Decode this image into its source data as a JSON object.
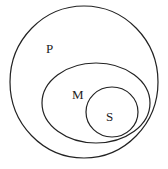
{
  "diagram": {
    "type": "nested-sets",
    "sets": [
      {
        "label": "P",
        "cx": 84,
        "cy": 82,
        "rx": 74,
        "ry": 76,
        "label_x": 46,
        "label_y": 53
      },
      {
        "label": "M",
        "cx": 96,
        "cy": 103,
        "rx": 54,
        "ry": 40,
        "label_x": 72,
        "label_y": 99
      },
      {
        "label": "S",
        "cx": 112,
        "cy": 112,
        "rx": 26,
        "ry": 25,
        "label_x": 106,
        "label_y": 121
      }
    ],
    "stroke_color": "#222222",
    "background": "#ffffff"
  }
}
